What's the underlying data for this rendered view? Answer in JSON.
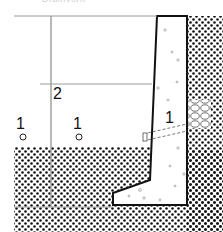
{
  "figure": {
    "caption_partial": "Drainvorh",
    "type": "retaining-wall-cross-section",
    "labels": [
      {
        "id": "soil-left",
        "text": "1",
        "x": 8,
        "y": 118
      },
      {
        "id": "soil-mid",
        "text": "1",
        "x": 73,
        "y": 118
      },
      {
        "id": "water-level",
        "text": "2",
        "x": 52,
        "y": 89
      },
      {
        "id": "wall-drain",
        "text": "1",
        "x": 164,
        "y": 111
      }
    ],
    "colors": {
      "ink": "#111111",
      "guide_line": "#9a9a9a",
      "dot_pattern": "#111111",
      "background": "#ffffff"
    }
  }
}
